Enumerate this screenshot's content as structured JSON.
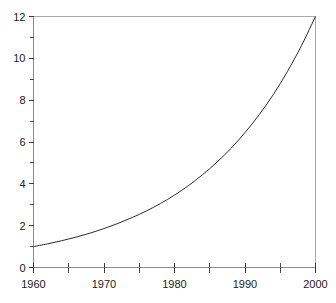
{
  "chart_data": {
    "type": "line",
    "title": "",
    "subtitle": "",
    "xlabel": "",
    "ylabel": "",
    "xlim": [
      1960,
      2000
    ],
    "ylim": [
      0,
      12
    ],
    "grid": false,
    "legend": null,
    "x_ticks_major": [
      1960,
      1970,
      1980,
      1990,
      2000
    ],
    "x_ticks_major_labels": [
      "1960",
      "1970",
      "1980",
      "1990",
      "2000"
    ],
    "x_ticks_minor": [
      1965,
      1975,
      1985,
      1995
    ],
    "y_ticks_major": [
      0,
      2,
      4,
      6,
      8,
      10,
      12
    ],
    "y_ticks_major_labels": [
      "0",
      "2",
      "4",
      "6",
      "8",
      "10",
      "12"
    ],
    "y_ticks_minor": [
      1,
      3,
      5,
      7,
      9,
      11
    ],
    "series": [
      {
        "name": "growth",
        "color": "#2b2b2b",
        "x": [
          1960,
          1962,
          1964,
          1966,
          1968,
          1970,
          1972,
          1974,
          1976,
          1978,
          1980,
          1982,
          1984,
          1986,
          1988,
          1990,
          1992,
          1994,
          1996,
          1998,
          2000
        ],
        "values": [
          1.0,
          1.13,
          1.28,
          1.45,
          1.64,
          1.86,
          2.11,
          2.39,
          2.7,
          3.06,
          3.46,
          3.92,
          4.44,
          5.03,
          5.69,
          6.45,
          7.3,
          8.26,
          9.36,
          10.6,
          12.0
        ]
      }
    ],
    "axis_color": "#8a8a8a",
    "frame_color": "#a8a8a8",
    "tick_color": "#3a3a3a",
    "background_color": "#ffffff",
    "text_color": "#1a1a1a"
  },
  "labels": {
    "y": [
      "12",
      "10",
      "8",
      "6",
      "4",
      "2",
      "0"
    ],
    "x": [
      "1960",
      "1970",
      "1980",
      "1990",
      "2000"
    ]
  }
}
